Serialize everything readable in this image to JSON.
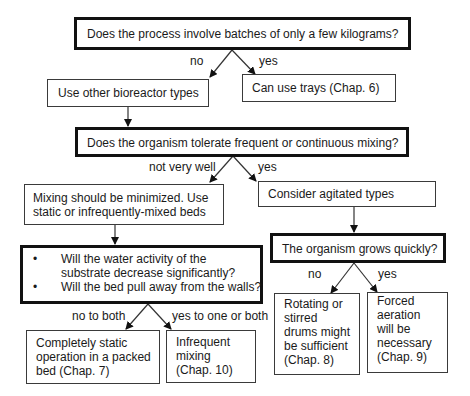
{
  "decisions": {
    "q1": "Does the process involve batches of only a few kilograms?",
    "q2": "Does the organism tolerate frequent or continuous mixing?",
    "q3_bullets": [
      "Will the water activity of the substrate decrease significantly?",
      "Will the bed pull away from the walls?"
    ],
    "q4": "The organism grows quickly?"
  },
  "outcomes": {
    "other_types": "Use other bioreactor types",
    "trays": "Can use trays (Chap. 6)",
    "minimize": [
      "Mixing should be minimized. Use",
      "static or infrequently-mixed beds"
    ],
    "agitated": "Consider agitated types",
    "packed_bed": [
      "Completely static",
      "operation in a packed",
      "bed (Chap. 7)"
    ],
    "infrequent": [
      "Infrequent",
      "mixing",
      "(Chap. 10)"
    ],
    "rotating": [
      "Rotating or",
      "stirred",
      "drums might",
      "be sufficient",
      "(Chap. 8)"
    ],
    "forced": [
      "Forced",
      "aeration",
      "will be",
      "necessary",
      "(Chap. 9)"
    ]
  },
  "edge_labels": {
    "q1_no": "no",
    "q1_yes": "yes",
    "q2_no": "not very well",
    "q2_yes": "yes",
    "q3_no": "no to both",
    "q3_yes": "yes to one or both",
    "q4_no": "no",
    "q4_yes": "yes"
  }
}
